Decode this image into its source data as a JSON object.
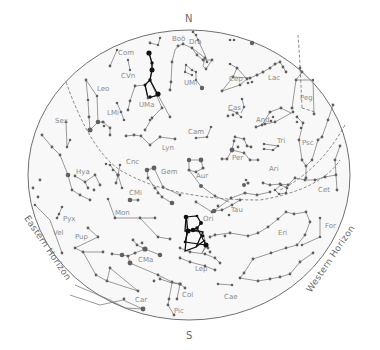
{
  "map": {
    "type": "star-chart",
    "colors": {
      "background": "#ffffff",
      "sky": "#f7f7f7",
      "border": "#707070",
      "line": "#707070",
      "star": "#606060",
      "highlight_star": "#111111",
      "highlight_line": "#111111",
      "label": "#8a8a8a",
      "dashed": "#555555"
    },
    "compass": {
      "north": "N",
      "south": "S"
    },
    "horizons": {
      "east": "Eastern Horizon",
      "west": "Western Horizon"
    },
    "labels": [
      {
        "name": "Boö",
        "x": 172,
        "y": 41
      },
      {
        "name": "Dra",
        "x": 189,
        "y": 44
      },
      {
        "name": "Com",
        "x": 118,
        "y": 55
      },
      {
        "name": "CVn",
        "x": 121,
        "y": 78
      },
      {
        "name": "UMi",
        "x": 184,
        "y": 85
      },
      {
        "name": "Cep",
        "x": 229,
        "y": 81
      },
      {
        "name": "Lac",
        "x": 268,
        "y": 80
      },
      {
        "name": "Peg",
        "x": 300,
        "y": 100
      },
      {
        "name": "Leo",
        "x": 97,
        "y": 91
      },
      {
        "name": "LMi",
        "x": 107,
        "y": 115
      },
      {
        "name": "UMa",
        "x": 139,
        "y": 107
      },
      {
        "name": "Cas",
        "x": 228,
        "y": 110
      },
      {
        "name": "And",
        "x": 256,
        "y": 122
      },
      {
        "name": "Sex",
        "x": 55,
        "y": 123
      },
      {
        "name": "Cam",
        "x": 188,
        "y": 134
      },
      {
        "name": "Tri",
        "x": 277,
        "y": 143
      },
      {
        "name": "Psc",
        "x": 302,
        "y": 145
      },
      {
        "name": "Lyn",
        "x": 162,
        "y": 150
      },
      {
        "name": "Per",
        "x": 232,
        "y": 160
      },
      {
        "name": "Ari",
        "x": 269,
        "y": 171
      },
      {
        "name": "Cnc",
        "x": 126,
        "y": 164
      },
      {
        "name": "Hya",
        "x": 76,
        "y": 174
      },
      {
        "name": "Gem",
        "x": 161,
        "y": 174
      },
      {
        "name": "Aur",
        "x": 196,
        "y": 178
      },
      {
        "name": "Cet",
        "x": 318,
        "y": 192
      },
      {
        "name": "Tau",
        "x": 231,
        "y": 212
      },
      {
        "name": "CMi",
        "x": 129,
        "y": 195
      },
      {
        "name": "Ori",
        "x": 203,
        "y": 221
      },
      {
        "name": "For",
        "x": 325,
        "y": 228
      },
      {
        "name": "Mon",
        "x": 115,
        "y": 215
      },
      {
        "name": "Eri",
        "x": 278,
        "y": 235
      },
      {
        "name": "Pyx",
        "x": 63,
        "y": 221
      },
      {
        "name": "Vel",
        "x": 53,
        "y": 235
      },
      {
        "name": "Pup",
        "x": 75,
        "y": 239
      },
      {
        "name": "CMa",
        "x": 138,
        "y": 262
      },
      {
        "name": "Lep",
        "x": 195,
        "y": 271
      },
      {
        "name": "Car",
        "x": 135,
        "y": 302
      },
      {
        "name": "Col",
        "x": 182,
        "y": 297
      },
      {
        "name": "Cae",
        "x": 224,
        "y": 299
      },
      {
        "name": "Pic",
        "x": 174,
        "y": 313
      }
    ]
  }
}
